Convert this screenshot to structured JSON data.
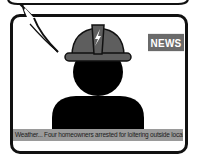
{
  "scene": {
    "title": "Breaking news broadcast illustration",
    "badge": {
      "label": "NEWS",
      "color": "#6a6a6a"
    },
    "ticker": {
      "text": "Weather... Four homeowners arrested for loitering outside local bar... Amber",
      "background": "#9a9a9a"
    },
    "anchor": {
      "hard_hat_color": "#5e5e5e",
      "silhouette_color": "#000000",
      "icon": "lightning-bolt-icon"
    },
    "speech_bubble": {
      "visible": true
    }
  }
}
